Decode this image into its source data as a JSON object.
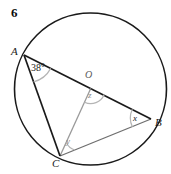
{
  "figure": {
    "number": "6",
    "points": {
      "A": "A",
      "B": "B",
      "C": "C",
      "O": "O"
    },
    "angles": {
      "at_A": "38°",
      "at_B": "x",
      "at_C": "y",
      "at_O": "z"
    },
    "colors": {
      "stroke_dark": "#1a1a1a",
      "stroke_gray": "#9a9a9a",
      "arc_gray": "#b5b5b5",
      "background": "#ffffff"
    },
    "geometry": {
      "circle": {
        "cx": 90.5,
        "cy": 89,
        "r": 76
      },
      "A": {
        "x": 24,
        "y": 55
      },
      "B": {
        "x": 151,
        "y": 119
      },
      "C": {
        "x": 60,
        "y": 156
      },
      "O": {
        "x": 90.5,
        "y": 89
      }
    }
  }
}
